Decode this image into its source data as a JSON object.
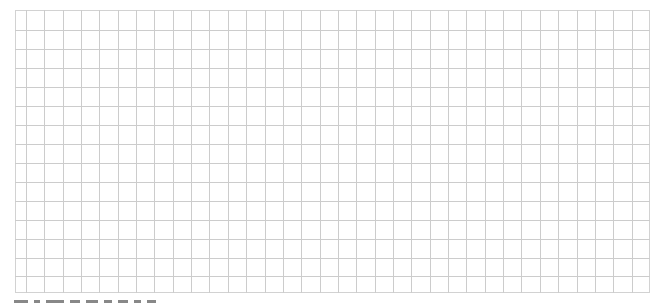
{
  "grid": {
    "origin_x": 15,
    "origin_y": 10,
    "width": 635,
    "height": 283,
    "first_column_width": 11,
    "column_count": 35,
    "column_pitch": 18.35,
    "row_count": 15,
    "row_pitch": 19.0,
    "last_row_height": 17,
    "line_color": "#cccccc",
    "border_color": "#d2d2d2",
    "background": "#ffffff"
  },
  "caption": {
    "text": "",
    "note_visible": "partially cropped text line at bottom edge",
    "fragments": [
      14,
      6,
      18,
      10,
      12,
      8,
      10,
      7,
      9
    ]
  }
}
